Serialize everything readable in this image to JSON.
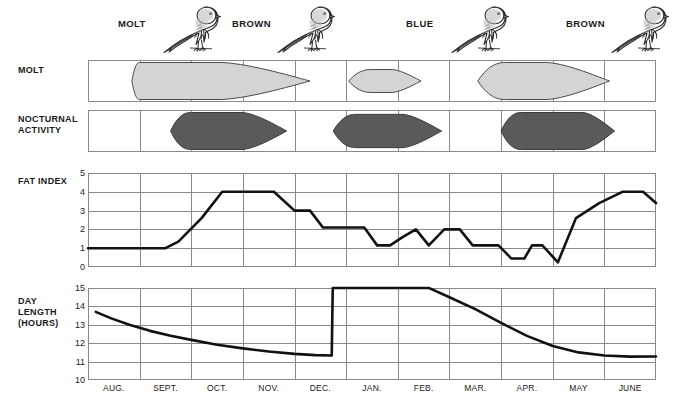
{
  "figure": {
    "row_labels": {
      "molt": "MOLT",
      "nocturnal_line1": "NOCTURNAL",
      "nocturnal_line2": "ACTIVITY",
      "fat": "FAT INDEX",
      "day_line1": "DAY",
      "day_line2": "LENGTH",
      "day_line3": "(HOURS)"
    },
    "bird_labels": [
      {
        "text": "MOLT",
        "x": 118,
        "y": 18
      },
      {
        "text": "BROWN",
        "x": 232,
        "y": 18
      },
      {
        "text": "BLUE",
        "x": 406,
        "y": 18
      },
      {
        "text": "BROWN",
        "x": 566,
        "y": 18
      }
    ],
    "bird_icon": "bird-icon",
    "colors": {
      "molt_fill": "#d4d4d4",
      "molt_stroke": "#4a4a4a",
      "nocturnal_fill": "#5a5a5a",
      "nocturnal_stroke": "#3b3b3b",
      "grid": "#8a8a8a",
      "line": "#111111",
      "text": "#1a1a1a"
    }
  },
  "chart_data": [
    {
      "type": "area",
      "name": "molt-band",
      "title": "MOLT",
      "categories": [
        "AUG.",
        "SEPT.",
        "OCT.",
        "NOV.",
        "DEC.",
        "JAN.",
        "FEB.",
        "MAR.",
        "APR.",
        "MAY",
        "JUNE"
      ],
      "grid": true,
      "legend": "none",
      "periods": [
        {
          "label": "post-juvenal / post-nuptial molt",
          "start_month": 0.85,
          "peak_start": 1.0,
          "peak_end": 2.6,
          "end_month": 4.3,
          "intensity": 1.0
        },
        {
          "label": "pre-alternate molt",
          "start_month": 5.05,
          "peak_start": 5.5,
          "peak_end": 5.9,
          "end_month": 6.45,
          "intensity": 0.62
        },
        {
          "label": "pre-basic / spring molt",
          "start_month": 7.55,
          "peak_start": 8.1,
          "peak_end": 8.9,
          "end_month": 10.1,
          "intensity": 1.0
        }
      ]
    },
    {
      "type": "area",
      "name": "nocturnal-activity-band",
      "title": "NOCTURNAL ACTIVITY",
      "categories": [
        "AUG.",
        "SEPT.",
        "OCT.",
        "NOV.",
        "DEC.",
        "JAN.",
        "FEB.",
        "MAR.",
        "APR.",
        "MAY",
        "JUNE"
      ],
      "grid": true,
      "legend": "none",
      "periods": [
        {
          "label": "autumn migratory restlessness",
          "start_month": 1.6,
          "peak_start": 2.0,
          "peak_end": 3.0,
          "end_month": 3.85,
          "intensity": 1.0
        },
        {
          "label": "mid-winter restlessness",
          "start_month": 4.75,
          "peak_start": 5.2,
          "peak_end": 6.1,
          "end_month": 6.85,
          "intensity": 0.9
        },
        {
          "label": "spring migratory restlessness",
          "start_month": 8.0,
          "peak_start": 8.4,
          "peak_end": 9.6,
          "end_month": 10.2,
          "intensity": 1.0
        }
      ]
    },
    {
      "type": "line",
      "name": "fat-index-chart",
      "title": "FAT INDEX",
      "xlabel": "",
      "ylabel": "FAT INDEX",
      "ylim": [
        0,
        5
      ],
      "yticks": [
        0,
        1,
        2,
        3,
        4,
        5
      ],
      "xticks": [
        "AUG.",
        "SEPT.",
        "OCT.",
        "NOV.",
        "DEC.",
        "JAN.",
        "FEB.",
        "MAR.",
        "APR.",
        "MAY",
        "JUNE"
      ],
      "grid": true,
      "x": [
        0.0,
        0.5,
        1.0,
        1.5,
        1.75,
        2.2,
        2.6,
        3.1,
        3.45,
        3.6,
        4.0,
        4.3,
        4.55,
        4.85,
        5.1,
        5.35,
        5.6,
        5.85,
        6.1,
        6.35,
        6.6,
        6.9,
        7.2,
        7.45,
        7.7,
        7.95,
        8.2,
        8.45,
        8.6,
        8.8,
        9.1,
        9.45,
        9.9,
        10.35,
        10.75,
        11.0
      ],
      "y": [
        1,
        1,
        1,
        1,
        1.35,
        2.6,
        4,
        4,
        4,
        4,
        3,
        3,
        2.1,
        2.1,
        2.1,
        2.1,
        1.15,
        1.15,
        1.6,
        2,
        1.15,
        2,
        2,
        1.15,
        1.15,
        1.15,
        0.45,
        0.45,
        1.15,
        1.15,
        0.25,
        2.6,
        3.4,
        4,
        4,
        3.4
      ],
      "annotations": []
    },
    {
      "type": "line",
      "name": "day-length-chart",
      "title": "DAY LENGTH (HOURS)",
      "xlabel": "",
      "ylabel": "DAY LENGTH (HOURS)",
      "ylim": [
        10,
        15
      ],
      "yticks": [
        10,
        11,
        12,
        13,
        14,
        15
      ],
      "xticks": [
        "AUG.",
        "SEPT.",
        "OCT.",
        "NOV.",
        "DEC.",
        "JAN.",
        "FEB.",
        "MAR.",
        "APR.",
        "MAY",
        "JUNE"
      ],
      "grid": true,
      "x": [
        0.15,
        0.45,
        0.8,
        1.2,
        1.6,
        2.0,
        2.5,
        3.0,
        3.5,
        4.0,
        4.4,
        4.72,
        4.74,
        5.2,
        6.0,
        6.6,
        6.62,
        7.0,
        7.5,
        8.0,
        8.5,
        9.0,
        9.5,
        10.0,
        10.5,
        11.0
      ],
      "y": [
        13.7,
        13.35,
        13.0,
        12.67,
        12.4,
        12.18,
        11.92,
        11.72,
        11.55,
        11.42,
        11.35,
        11.33,
        15.0,
        15.0,
        15.0,
        15.0,
        14.98,
        14.5,
        13.85,
        13.1,
        12.4,
        11.85,
        11.5,
        11.33,
        11.27,
        11.28
      ],
      "annotations": [
        {
          "text": "abrupt photoperiod shift",
          "x": 4.73,
          "y": 13.2
        }
      ]
    }
  ],
  "months": [
    {
      "label": "AUG.",
      "index": 0
    },
    {
      "label": "SEPT.",
      "index": 1
    },
    {
      "label": "OCT.",
      "index": 2
    },
    {
      "label": "NOV.",
      "index": 3
    },
    {
      "label": "DEC.",
      "index": 4
    },
    {
      "label": "JAN.",
      "index": 5
    },
    {
      "label": "FEB.",
      "index": 6
    },
    {
      "label": "MAR.",
      "index": 7
    },
    {
      "label": "APR.",
      "index": 8
    },
    {
      "label": "MAY",
      "index": 9
    },
    {
      "label": "JUNE",
      "index": 10
    }
  ],
  "fat_axis": {
    "ticks": [
      "5",
      "4",
      "3",
      "2",
      "1",
      "0"
    ]
  },
  "day_axis": {
    "ticks": [
      "15",
      "14",
      "13",
      "12",
      "11",
      "10"
    ]
  }
}
